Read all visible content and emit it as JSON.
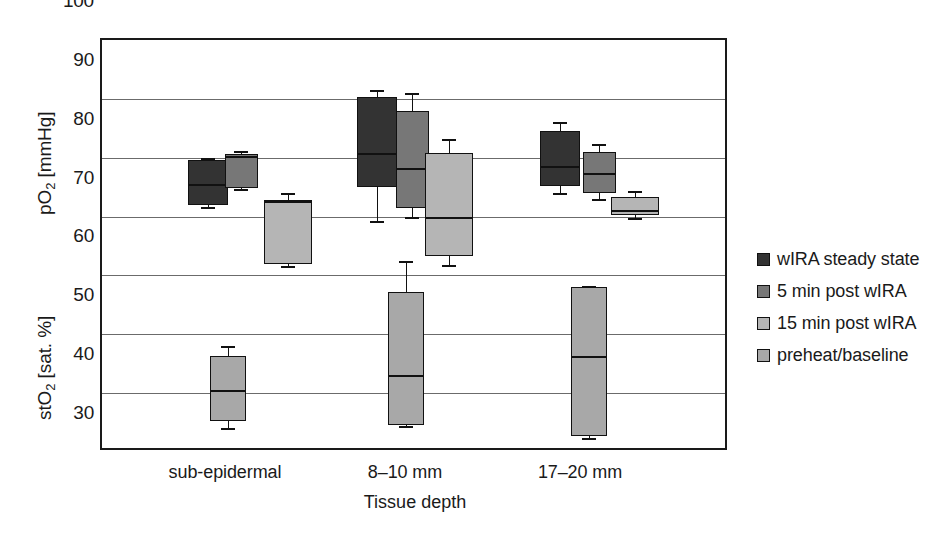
{
  "chart_data": {
    "type": "box",
    "title": "",
    "xlabel": "Tissue depth",
    "ylabel_upper": "pO2 [mmHg]",
    "ylabel_lower": "stO2 [sat. %]",
    "ylim": [
      30,
      100
    ],
    "yticks": [
      100,
      90,
      80,
      70,
      60,
      50,
      40,
      30
    ],
    "grid": true,
    "legend_position": "right",
    "categories": [
      "sub-epidermal",
      "8–10 mm",
      "17–20 mm"
    ],
    "series": [
      {
        "name": "wIRA steady state",
        "color": "#333333",
        "measure": "pO2",
        "boxes": [
          {
            "category": "sub-epidermal",
            "whisker_low": 71.6,
            "q1": 71.9,
            "median": 75.6,
            "q3": 79.6,
            "whisker_high": 80.0
          },
          {
            "category": "8–10 mm",
            "whisker_low": 69.2,
            "q1": 75.0,
            "median": 80.8,
            "q3": 90.3,
            "whisker_high": 91.5
          },
          {
            "category": "17–20 mm",
            "whisker_low": 74.0,
            "q1": 75.2,
            "median": 78.6,
            "q3": 84.6,
            "whisker_high": 86.0
          }
        ]
      },
      {
        "name": "5 min post wIRA",
        "color": "#777777",
        "measure": "pO2",
        "boxes": [
          {
            "category": "sub-epidermal",
            "whisker_low": 74.6,
            "q1": 74.8,
            "median": 80.3,
            "q3": 80.6,
            "whisker_high": 81.2
          },
          {
            "category": "8–10 mm",
            "whisker_low": 70.0,
            "q1": 71.4,
            "median": 78.3,
            "q3": 88.0,
            "whisker_high": 91.0
          },
          {
            "category": "17–20 mm",
            "whisker_low": 73.0,
            "q1": 74.0,
            "median": 77.4,
            "q3": 81.0,
            "whisker_high": 82.4
          }
        ]
      },
      {
        "name": "15 min post wIRA",
        "color": "#b5b5b5",
        "measure": "pO2",
        "boxes": [
          {
            "category": "sub-epidermal",
            "whisker_low": 61.6,
            "q1": 61.9,
            "median": 72.6,
            "q3": 72.9,
            "whisker_high": 74.0
          },
          {
            "category": "8–10 mm",
            "whisker_low": 61.7,
            "q1": 63.3,
            "median": 70.0,
            "q3": 80.8,
            "whisker_high": 83.2
          },
          {
            "category": "17–20 mm",
            "whisker_low": 69.8,
            "q1": 70.2,
            "median": 71.2,
            "q3": 73.4,
            "whisker_high": 74.4
          }
        ]
      },
      {
        "name": "preheat/baseline",
        "color": "#a8a8a8",
        "measure": "stO2",
        "boxes": [
          {
            "category": "sub-epidermal",
            "whisker_low": 34.0,
            "q1": 35.3,
            "median": 40.5,
            "q3": 46.3,
            "whisker_high": 48.0
          },
          {
            "category": "8–10 mm",
            "whisker_low": 34.4,
            "q1": 34.6,
            "median": 43.0,
            "q3": 57.1,
            "whisker_high": 62.4
          },
          {
            "category": "17–20 mm",
            "whisker_low": 32.3,
            "q1": 32.8,
            "median": 46.3,
            "q3": 58.0,
            "whisker_high": 58.2
          }
        ]
      }
    ]
  },
  "axes": {
    "y_title_upper": "pO",
    "y_title_upper_sub": "2",
    "y_title_upper_unit": " [mmHg]",
    "y_title_lower": "stO",
    "y_title_lower_sub": "2",
    "y_title_lower_unit": " [sat. %]",
    "x_title": "Tissue depth",
    "ticks": [
      "100",
      "90",
      "80",
      "70",
      "60",
      "50",
      "40",
      "30"
    ],
    "categories": [
      "sub-epidermal",
      "8–10 mm",
      "17–20 mm"
    ]
  },
  "legend": {
    "items": [
      {
        "label": "wIRA steady state",
        "color": "#333333"
      },
      {
        "label": "5 min post wIRA",
        "color": "#777777"
      },
      {
        "label": "15 min post wIRA",
        "color": "#b5b5b5"
      },
      {
        "label": "preheat/baseline",
        "color": "#a8a8a8"
      }
    ]
  }
}
